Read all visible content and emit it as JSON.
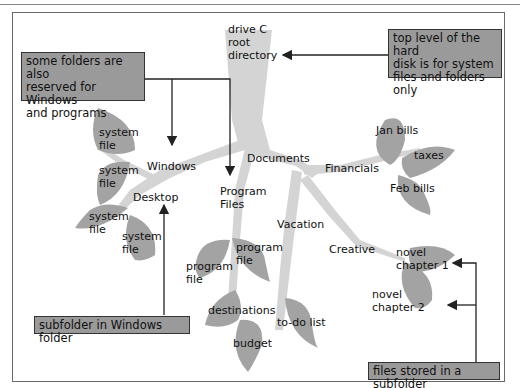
{
  "diagram": {
    "root": {
      "label_line1": "drive C",
      "label_line2": "root",
      "label_line3": "directory"
    },
    "folders": {
      "windows": "Windows",
      "desktop": "Desktop",
      "program_files_line1": "Program",
      "program_files_line2": "Files",
      "documents": "Documents",
      "financials": "Financials",
      "vacation": "Vacation",
      "creative": "Creative"
    },
    "files": {
      "system_file_line1": "system",
      "system_file_line2": "file",
      "program_file_line1": "program",
      "program_file_line2": "file",
      "jan_bills": "Jan bills",
      "taxes": "taxes",
      "feb_bills": "Feb bills",
      "destinations": "destinations",
      "todo_list": "to-do list",
      "budget": "budget",
      "novel_line1": "novel",
      "chapter1": "chapter 1",
      "chapter2": "chapter 2"
    },
    "callouts": {
      "reserved": {
        "line1": "some folders are also",
        "line2": "reserved for Windows",
        "line3": "and programs"
      },
      "top_level": {
        "line1": "top level of the hard",
        "line2": "disk is for system",
        "line3": "files and folders only"
      },
      "subfolder": "subfolder in Windows folder",
      "files_stored": "files stored in a subfolder"
    },
    "colors": {
      "trunk": "#d4d4d4",
      "leaf": "#a3a3a3",
      "callout_bg": "#9a9a9a",
      "arrow": "#222222"
    }
  }
}
